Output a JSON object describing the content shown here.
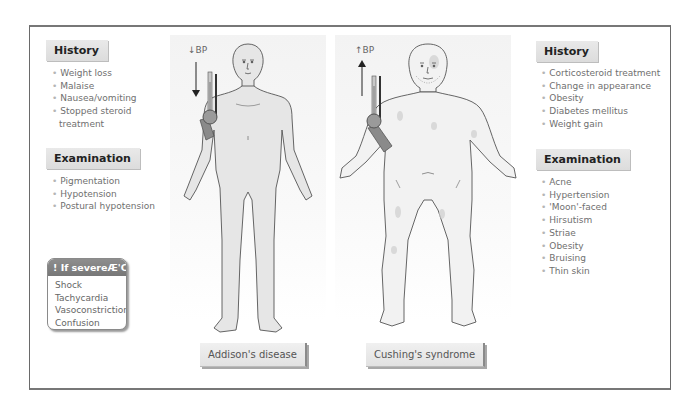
{
  "left": {
    "history": {
      "title": "History",
      "items": [
        "Weight loss",
        "Malaise",
        "Nausea/vomiting",
        "Stopped steroid",
        "treatment"
      ]
    },
    "examination": {
      "title": "Examination",
      "items": [
        "Pigmentation",
        "Hypotension",
        "Postural hypotension"
      ]
    },
    "crisis": {
      "title": "! If severeÆ'Crisis'",
      "items": [
        "Shock",
        "Tachycardia",
        "Vasoconstriction",
        "Confusion"
      ]
    }
  },
  "figures": {
    "addison": {
      "bp_label": "↓BP",
      "caption": "Addison's disease"
    },
    "cushing": {
      "bp_label": "↑BP",
      "caption": "Cushing's syndrome"
    }
  },
  "right": {
    "history": {
      "title": "History",
      "items": [
        "Corticosteroid treatment",
        "Change in appearance",
        "Obesity",
        "Diabetes mellitus",
        "Weight gain"
      ]
    },
    "examination": {
      "title": "Examination",
      "items": [
        "Acne",
        "Hypertension",
        "'Moon'-faced",
        "Hirsutism",
        "Striae",
        "Obesity",
        "Bruising",
        "Thin skin"
      ]
    }
  },
  "colors": {
    "frame": "#6a6a6a",
    "tag_bg": "#e2e2e2",
    "crisis_header": "#808080",
    "body_fill": "#e6e6e6",
    "text": "#6f6f6f"
  }
}
